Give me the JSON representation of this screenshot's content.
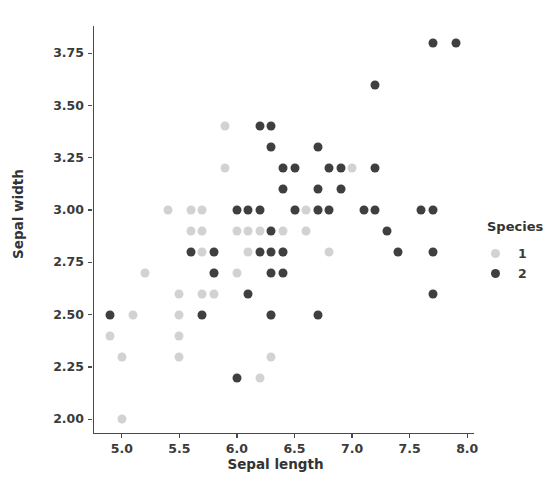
{
  "chart_data": {
    "type": "scatter",
    "title": "",
    "xlabel": "Sepal length",
    "ylabel": "Sepal width",
    "xlim": [
      4.75,
      8.05
    ],
    "ylim": [
      1.93,
      3.88
    ],
    "xticks": [
      "5.0",
      "5.5",
      "6.0",
      "6.5",
      "7.0",
      "7.5",
      "8.0"
    ],
    "xtick_values": [
      5.0,
      5.5,
      6.0,
      6.5,
      7.0,
      7.5,
      8.0
    ],
    "yticks": [
      "2.00",
      "2.25",
      "2.50",
      "2.75",
      "3.00",
      "3.25",
      "3.50",
      "3.75"
    ],
    "ytick_values": [
      2.0,
      2.25,
      2.5,
      2.75,
      3.0,
      3.25,
      3.5,
      3.75
    ],
    "grid": false,
    "legend_position": "right",
    "legend": {
      "title": "Species",
      "entries": [
        {
          "label": "1",
          "color": "#d2d2d2"
        },
        {
          "label": "2",
          "color": "#3f3f3f"
        }
      ]
    },
    "series": [
      {
        "name": "1",
        "color": "#d2d2d2",
        "points": [
          [
            4.9,
            2.4
          ],
          [
            5.0,
            2.0
          ],
          [
            5.0,
            2.3
          ],
          [
            5.1,
            2.5
          ],
          [
            5.2,
            2.7
          ],
          [
            5.4,
            3.0
          ],
          [
            5.5,
            2.3
          ],
          [
            5.5,
            2.4
          ],
          [
            5.5,
            2.5
          ],
          [
            5.5,
            2.6
          ],
          [
            5.6,
            2.9
          ],
          [
            5.6,
            3.0
          ],
          [
            5.7,
            2.6
          ],
          [
            5.7,
            2.8
          ],
          [
            5.7,
            2.9
          ],
          [
            5.7,
            3.0
          ],
          [
            5.8,
            2.6
          ],
          [
            5.8,
            2.7
          ],
          [
            5.9,
            3.2
          ],
          [
            5.9,
            3.4
          ],
          [
            6.0,
            2.7
          ],
          [
            6.0,
            2.9
          ],
          [
            6.1,
            2.8
          ],
          [
            6.1,
            2.9
          ],
          [
            6.2,
            2.9
          ],
          [
            6.2,
            2.2
          ],
          [
            6.3,
            2.3
          ],
          [
            6.3,
            2.5
          ],
          [
            6.4,
            2.9
          ],
          [
            6.4,
            2.8
          ],
          [
            6.5,
            3.0
          ],
          [
            6.6,
            2.9
          ],
          [
            6.6,
            3.0
          ],
          [
            6.7,
            3.0
          ],
          [
            6.8,
            2.8
          ],
          [
            7.0,
            3.2
          ]
        ]
      },
      {
        "name": "2",
        "color": "#3f3f3f",
        "points": [
          [
            4.9,
            2.5
          ],
          [
            5.6,
            2.8
          ],
          [
            5.7,
            2.5
          ],
          [
            5.8,
            2.7
          ],
          [
            5.8,
            2.8
          ],
          [
            6.0,
            2.2
          ],
          [
            6.0,
            3.0
          ],
          [
            6.1,
            2.6
          ],
          [
            6.1,
            3.0
          ],
          [
            6.2,
            2.8
          ],
          [
            6.2,
            3.4
          ],
          [
            6.2,
            3.0
          ],
          [
            6.3,
            2.5
          ],
          [
            6.3,
            2.7
          ],
          [
            6.3,
            2.8
          ],
          [
            6.3,
            2.9
          ],
          [
            6.3,
            3.3
          ],
          [
            6.3,
            3.4
          ],
          [
            6.4,
            2.7
          ],
          [
            6.4,
            2.8
          ],
          [
            6.4,
            3.1
          ],
          [
            6.4,
            3.2
          ],
          [
            6.5,
            3.0
          ],
          [
            6.5,
            3.2
          ],
          [
            6.7,
            2.5
          ],
          [
            6.7,
            3.0
          ],
          [
            6.7,
            3.1
          ],
          [
            6.7,
            3.3
          ],
          [
            6.8,
            3.0
          ],
          [
            6.8,
            3.2
          ],
          [
            6.9,
            3.1
          ],
          [
            6.9,
            3.2
          ],
          [
            7.1,
            3.0
          ],
          [
            7.2,
            3.0
          ],
          [
            7.2,
            3.2
          ],
          [
            7.2,
            3.6
          ],
          [
            7.3,
            2.9
          ],
          [
            7.4,
            2.8
          ],
          [
            7.6,
            3.0
          ],
          [
            7.7,
            2.6
          ],
          [
            7.7,
            2.8
          ],
          [
            7.7,
            3.0
          ],
          [
            7.7,
            3.8
          ],
          [
            7.9,
            3.8
          ]
        ]
      }
    ]
  }
}
